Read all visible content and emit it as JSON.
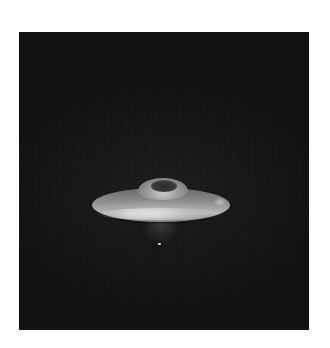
{
  "image": {
    "description": "Black-and-white photograph of a flying-saucer shaped object against a dark background",
    "subject": "saucer-shaped object",
    "background_color": "#141414",
    "page_background": "#ffffff",
    "frame": {
      "left": 19,
      "top": 32,
      "width": 290,
      "height": 298
    }
  }
}
